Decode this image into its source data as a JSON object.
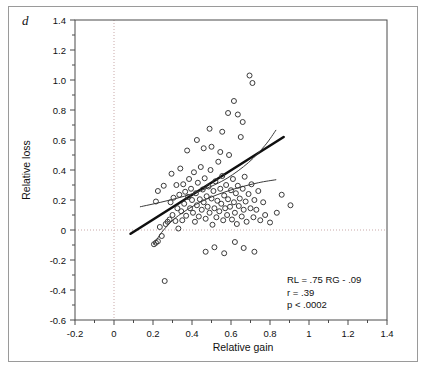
{
  "figure": {
    "panel_label": "d",
    "background_color": "#ffffff",
    "frame_color": "#9a9a9a"
  },
  "chart_data": {
    "type": "scatter",
    "title": "",
    "xlabel": "Relative gain",
    "ylabel": "Relative loss",
    "xlim": [
      -0.2,
      1.4
    ],
    "ylim": [
      -0.6,
      1.4
    ],
    "xticks": [
      -0.2,
      0,
      0.2,
      0.4,
      0.6,
      0.8,
      1,
      1.2,
      1.4
    ],
    "xtick_labels": [
      "-0.2",
      "0",
      "0.2",
      "0.4",
      "0.6",
      "0.8",
      "1",
      "1.2",
      "1.4"
    ],
    "yticks": [
      -0.6,
      -0.4,
      -0.2,
      0,
      0.2,
      0.4,
      0.6,
      0.8,
      1.0,
      1.2,
      1.4
    ],
    "ytick_labels": [
      "-0.6",
      "-0.4",
      "-0.2",
      "0",
      "0.2",
      "0.4",
      "0.6",
      "0.8",
      "1.0",
      "1.2",
      "1.4"
    ],
    "xminor_step": 0.1,
    "yminor_step": 0.1,
    "grid": "zero-lines-only",
    "gridlines": {
      "x": [
        0
      ],
      "y": [
        0
      ],
      "style": "dotted",
      "color": "#c9a9a9"
    },
    "legend": "none",
    "marker": {
      "shape": "open-circle",
      "size": 5,
      "color": "#3a3a3a"
    },
    "points": [
      [
        0.205,
        -0.095
      ],
      [
        0.215,
        -0.085
      ],
      [
        0.225,
        -0.075
      ],
      [
        0.235,
        0.02
      ],
      [
        0.245,
        -0.04
      ],
      [
        0.26,
        -0.34
      ],
      [
        0.265,
        0.04
      ],
      [
        0.275,
        0.055
      ],
      [
        0.285,
        0.07
      ],
      [
        0.29,
        0.185
      ],
      [
        0.3,
        0.1
      ],
      [
        0.305,
        0.215
      ],
      [
        0.315,
        0.06
      ],
      [
        0.32,
        0.3
      ],
      [
        0.325,
        0.145
      ],
      [
        0.33,
        0.01
      ],
      [
        0.335,
        0.235
      ],
      [
        0.34,
        0.41
      ],
      [
        0.345,
        0.125
      ],
      [
        0.35,
        0.065
      ],
      [
        0.355,
        0.305
      ],
      [
        0.36,
        0.175
      ],
      [
        0.365,
        0.255
      ],
      [
        0.37,
        0.095
      ],
      [
        0.375,
        0.53
      ],
      [
        0.38,
        0.22
      ],
      [
        0.385,
        0.34
      ],
      [
        0.39,
        0.145
      ],
      [
        0.395,
        0.275
      ],
      [
        0.4,
        0.2
      ],
      [
        0.405,
        0.115
      ],
      [
        0.41,
        0.385
      ],
      [
        0.415,
        0.055
      ],
      [
        0.42,
        0.245
      ],
      [
        0.425,
        0.165
      ],
      [
        0.43,
        0.315
      ],
      [
        0.435,
        0.09
      ],
      [
        0.44,
        0.205
      ],
      [
        0.445,
        0.42
      ],
      [
        0.45,
        0.135
      ],
      [
        0.455,
        0.27
      ],
      [
        0.46,
        0.185
      ],
      [
        0.465,
        0.345
      ],
      [
        0.47,
        0.075
      ],
      [
        0.475,
        0.225
      ],
      [
        0.48,
        0.155
      ],
      [
        0.485,
        0.29
      ],
      [
        0.49,
        0.115
      ],
      [
        0.495,
        0.4
      ],
      [
        0.5,
        0.21
      ],
      [
        0.505,
        0.035
      ],
      [
        0.51,
        0.26
      ],
      [
        0.515,
        0.145
      ],
      [
        0.52,
        0.325
      ],
      [
        0.525,
        0.085
      ],
      [
        0.53,
        0.195
      ],
      [
        0.535,
        0.455
      ],
      [
        0.54,
        0.125
      ],
      [
        0.545,
        0.275
      ],
      [
        0.55,
        0.175
      ],
      [
        0.555,
        0.36
      ],
      [
        0.56,
        0.065
      ],
      [
        0.565,
        0.23
      ],
      [
        0.57,
        0.145
      ],
      [
        0.575,
        0.3
      ],
      [
        0.58,
        0.1
      ],
      [
        0.585,
        0.205
      ],
      [
        0.59,
        0.5
      ],
      [
        0.595,
        0.155
      ],
      [
        0.6,
        0.265
      ],
      [
        0.605,
        0.07
      ],
      [
        0.61,
        0.34
      ],
      [
        0.615,
        0.185
      ],
      [
        0.62,
        0.115
      ],
      [
        0.625,
        0.245
      ],
      [
        0.63,
        0.04
      ],
      [
        0.635,
        0.295
      ],
      [
        0.64,
        0.16
      ],
      [
        0.645,
        0.21
      ],
      [
        0.65,
        0.62
      ],
      [
        0.655,
        0.09
      ],
      [
        0.66,
        0.275
      ],
      [
        0.665,
        0.135
      ],
      [
        0.67,
        0.355
      ],
      [
        0.675,
        0.19
      ],
      [
        0.68,
        0.055
      ],
      [
        0.69,
        0.24
      ],
      [
        0.695,
        1.03
      ],
      [
        0.7,
        0.145
      ],
      [
        0.705,
        0.305
      ],
      [
        0.71,
        0.98
      ],
      [
        0.715,
        0.085
      ],
      [
        0.72,
        0.2
      ],
      [
        0.73,
        0.135
      ],
      [
        0.74,
        0.26
      ],
      [
        0.75,
        0.065
      ],
      [
        0.765,
        0.185
      ],
      [
        0.775,
        0.1
      ],
      [
        0.585,
        0.78
      ],
      [
        0.615,
        0.86
      ],
      [
        0.46,
        0.545
      ],
      [
        0.5,
        0.555
      ],
      [
        0.545,
        0.52
      ],
      [
        0.425,
        0.6
      ],
      [
        0.295,
        0.375
      ],
      [
        0.255,
        0.295
      ],
      [
        0.86,
        0.235
      ],
      [
        0.905,
        0.165
      ],
      [
        0.635,
        0.77
      ],
      [
        0.66,
        0.72
      ],
      [
        0.215,
        0.19
      ],
      [
        0.225,
        0.26
      ],
      [
        0.47,
        -0.145
      ],
      [
        0.515,
        -0.115
      ],
      [
        0.565,
        -0.155
      ],
      [
        0.62,
        -0.08
      ],
      [
        0.665,
        -0.12
      ],
      [
        0.72,
        -0.145
      ],
      [
        0.555,
        0.655
      ],
      [
        0.49,
        0.675
      ],
      [
        0.8,
        0.05
      ],
      [
        0.835,
        0.115
      ]
    ],
    "fit_lines": [
      {
        "name": "regression-line",
        "style": "solid-bold",
        "color": "#0f0f0f",
        "width": 2.6,
        "points": [
          [
            0.085,
            -0.025
          ],
          [
            0.87,
            0.62
          ]
        ]
      },
      {
        "name": "confidence-band-upper",
        "style": "solid-thin",
        "color": "#3a3a3a",
        "width": 1,
        "points": [
          [
            0.135,
            0.155
          ],
          [
            0.24,
            0.185
          ],
          [
            0.36,
            0.225
          ],
          [
            0.47,
            0.275
          ],
          [
            0.58,
            0.345
          ],
          [
            0.69,
            0.45
          ],
          [
            0.775,
            0.565
          ],
          [
            0.83,
            0.665
          ]
        ]
      },
      {
        "name": "confidence-band-lower",
        "style": "solid-thin",
        "color": "#3a3a3a",
        "width": 1,
        "points": [
          [
            0.205,
            -0.095
          ],
          [
            0.245,
            -0.015
          ],
          [
            0.31,
            0.075
          ],
          [
            0.4,
            0.155
          ],
          [
            0.5,
            0.22
          ],
          [
            0.62,
            0.275
          ],
          [
            0.74,
            0.315
          ],
          [
            0.83,
            0.335
          ]
        ]
      }
    ],
    "annotations": [
      {
        "name": "equation",
        "text": "RL = .75 RG - .09"
      },
      {
        "name": "correlation",
        "text": "r = .39"
      },
      {
        "name": "p-value",
        "text": "p < .0002"
      }
    ],
    "statistics": {
      "slope": 0.75,
      "intercept": -0.09,
      "r": 0.39,
      "p": "< .0002"
    }
  }
}
